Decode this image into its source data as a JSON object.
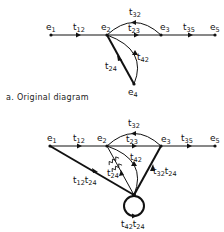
{
  "diagrams": [
    {
      "id": "a",
      "caption": "a. Original diagram",
      "nodes": [
        {
          "name": "e",
          "sub": "1"
        },
        {
          "name": "e",
          "sub": "2"
        },
        {
          "name": "e",
          "sub": "3"
        },
        {
          "name": "e",
          "sub": "5"
        },
        {
          "name": "e",
          "sub": "4"
        }
      ],
      "branches": [
        {
          "name": "t",
          "sub": "12"
        },
        {
          "name": "t",
          "sub": "23"
        },
        {
          "name": "t",
          "sub": "32"
        },
        {
          "name": "t",
          "sub": "35"
        },
        {
          "name": "t",
          "sub": "24"
        },
        {
          "name": "t",
          "sub": "42"
        }
      ]
    },
    {
      "id": "b",
      "caption": "",
      "nodes": [
        {
          "name": "e",
          "sub": "1"
        },
        {
          "name": "e",
          "sub": "2"
        },
        {
          "name": "e",
          "sub": "3"
        },
        {
          "name": "e",
          "sub": "5"
        }
      ],
      "branches": [
        {
          "name": "t",
          "sub": "12"
        },
        {
          "name": "t",
          "sub": "23"
        },
        {
          "name": "t",
          "sub": "32"
        },
        {
          "name": "t",
          "sub": "35"
        },
        {
          "name": "t",
          "sub": "42"
        },
        {
          "name": "t",
          "sub": "24"
        },
        {
          "name": "t",
          "sub": "12",
          "name2": "t",
          "sub2": "24"
        },
        {
          "name": "t",
          "sub": "32",
          "name2": "t",
          "sub2": "24"
        },
        {
          "name": "t",
          "sub": "42",
          "name2": "t",
          "sub2": "24"
        }
      ]
    }
  ]
}
